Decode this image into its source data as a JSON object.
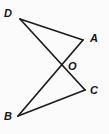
{
  "figure": {
    "background_color": "#fbfbfb",
    "line_color": "#1c1c1c",
    "label_color": "#141414",
    "width": 109,
    "height": 134,
    "points": {
      "D": {
        "label": "D",
        "x": 20,
        "y": 19,
        "label_x": 4,
        "label_y": 8
      },
      "A": {
        "label": "A",
        "x": 83,
        "y": 40,
        "label_x": 90,
        "label_y": 33
      },
      "O": {
        "label": "O",
        "x": 63,
        "y": 66,
        "label_x": 68,
        "label_y": 61
      },
      "C": {
        "label": "C",
        "x": 85,
        "y": 90,
        "label_x": 90,
        "label_y": 85
      },
      "B": {
        "label": "B",
        "x": 18,
        "y": 116,
        "label_x": 4,
        "label_y": 111
      }
    },
    "segments": [
      {
        "name": "segment-DA",
        "from": "D",
        "to": "A",
        "x1": 20,
        "y1": 19,
        "x2": 83,
        "y2": 40
      },
      {
        "name": "segment-DC",
        "from": "D",
        "to": "C",
        "x1": 20,
        "y1": 19,
        "x2": 85,
        "y2": 90
      },
      {
        "name": "segment-AB",
        "from": "A",
        "to": "B",
        "x1": 83,
        "y1": 40,
        "x2": 18,
        "y2": 116
      },
      {
        "name": "segment-BC",
        "from": "B",
        "to": "C",
        "x1": 18,
        "y1": 116,
        "x2": 85,
        "y2": 90
      }
    ]
  }
}
